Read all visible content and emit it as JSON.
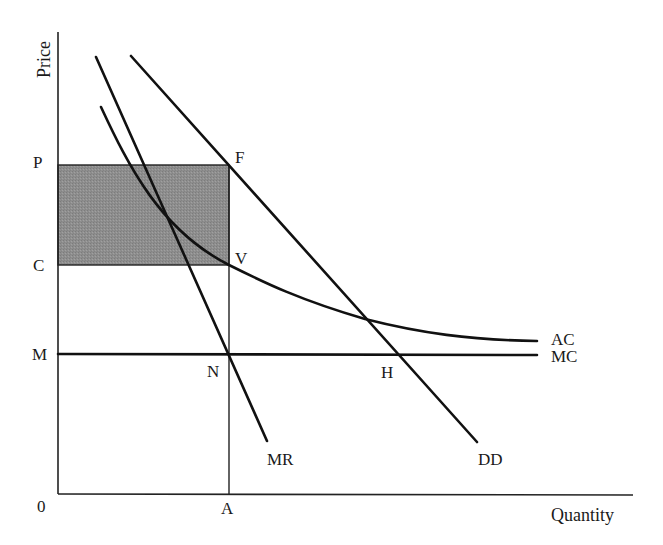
{
  "diagram": {
    "axes": {
      "y_label": "Price",
      "x_label": "Quantity",
      "origin_label": "0"
    },
    "price_labels": {
      "P": "P",
      "C": "C",
      "M": "M"
    },
    "quantity_labels": {
      "A": "A"
    },
    "point_labels": {
      "F": "F",
      "V": "V",
      "N": "N",
      "H": "H"
    },
    "curve_labels": {
      "AC": "AC",
      "MC": "MC",
      "MR": "MR",
      "DD": "DD"
    },
    "colors": {
      "line": "#111111",
      "profit_area": "#8c8c8c",
      "background": "#ffffff"
    },
    "shaded_region": {
      "name": "profit rectangle PFVC",
      "corners": [
        "P",
        "F",
        "V",
        "C"
      ]
    }
  }
}
